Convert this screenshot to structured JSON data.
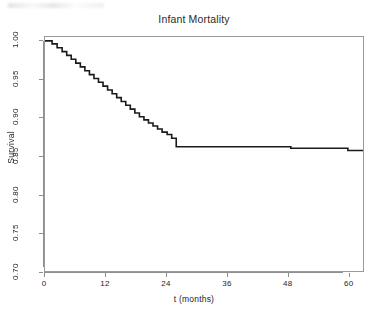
{
  "chart_data": {
    "type": "line",
    "subtype": "kaplan-meier-survival-step",
    "title": "Infant Mortality",
    "xlabel": "t (months)",
    "ylabel": "Survival",
    "xlim": [
      0,
      63
    ],
    "ylim": [
      0.7,
      1.005
    ],
    "grid": false,
    "legend": null,
    "xticks": [
      0,
      12,
      24,
      36,
      48,
      60
    ],
    "xticklabels": [
      "0",
      "12",
      "24",
      "36",
      "48",
      "60"
    ],
    "yticks": [
      0.7,
      0.75,
      0.8,
      0.85,
      0.9,
      0.95,
      1.0
    ],
    "yticklabels": [
      "0.70",
      "0.75",
      "0.80",
      "0.85",
      "0.90",
      "0.95",
      "1.00"
    ],
    "series": [
      {
        "name": "Survival",
        "step": "post",
        "color": "#1a1a1a",
        "x": [
          0,
          1.4,
          2.4,
          3.4,
          4.3,
          5.2,
          6.1,
          7.0,
          7.9,
          8.8,
          9.7,
          10.6,
          11.5,
          12.4,
          13.3,
          14.2,
          15.1,
          16.0,
          16.9,
          17.8,
          18.7,
          19.6,
          20.5,
          21.4,
          22.3,
          23.2,
          24.2,
          25.1,
          26.0,
          37.0,
          48.7,
          60.0,
          63.0
        ],
        "y": [
          1.0,
          0.996,
          0.991,
          0.986,
          0.981,
          0.976,
          0.971,
          0.966,
          0.961,
          0.956,
          0.951,
          0.946,
          0.941,
          0.936,
          0.931,
          0.926,
          0.921,
          0.916,
          0.911,
          0.906,
          0.901,
          0.897,
          0.893,
          0.889,
          0.885,
          0.881,
          0.878,
          0.873,
          0.862,
          0.862,
          0.86,
          0.857,
          0.857
        ]
      }
    ],
    "annotations": [
      {
        "text": "sharp drop at ~25 months",
        "x": 25.1,
        "y": 0.862
      },
      {
        "text": "small drop at ~37 months",
        "x": 37.0,
        "y": 0.86
      },
      {
        "text": "small drop at ~49 months",
        "x": 48.7,
        "y": 0.857
      }
    ]
  }
}
